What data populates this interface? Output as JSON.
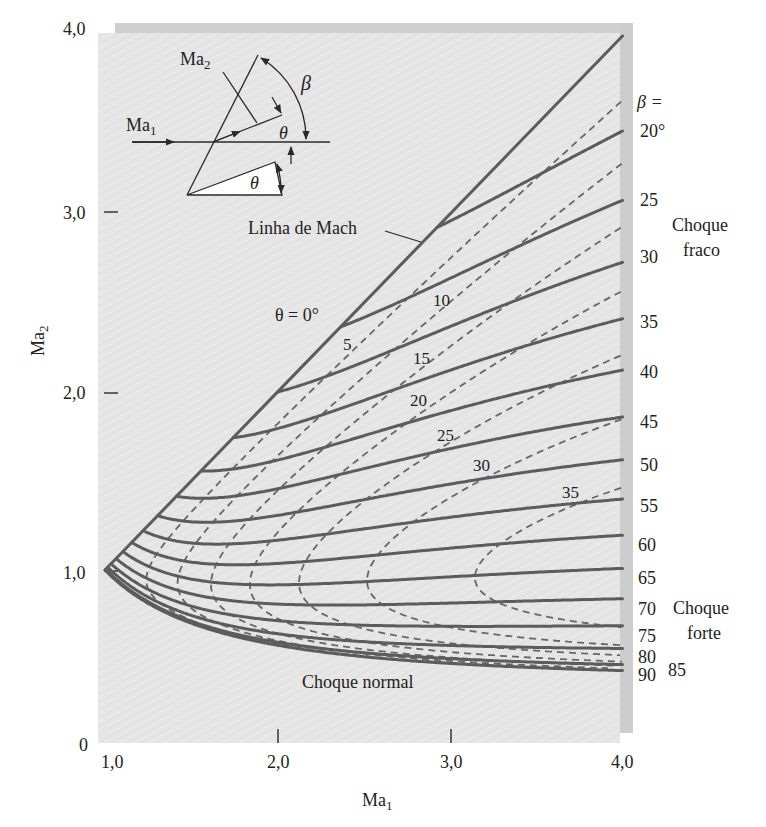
{
  "figure": {
    "y_axis": {
      "label": "Ma",
      "label_sub": "2",
      "ticks": [
        "4,0",
        "3,0",
        "2,0",
        "1,0",
        "0"
      ]
    },
    "x_axis": {
      "label": "Ma",
      "label_sub": "1",
      "ticks": [
        "1,0",
        "2,0",
        "3,0",
        "4,0"
      ]
    },
    "inset": {
      "ma1": "Ma",
      "ma1_sub": "1",
      "ma2": "Ma",
      "ma2_sub": "2",
      "beta": "β",
      "theta_flow": "θ",
      "theta_wedge": "θ"
    },
    "annotations": {
      "mach_line": "Linha de Mach",
      "theta_zero": "θ = 0°",
      "normal_shock": "Choque normal",
      "beta_header": "β =",
      "weak_shock": [
        "Choque",
        "fraco"
      ],
      "strong_shock": [
        "Choque",
        "forte"
      ]
    },
    "theta_labels": [
      "5",
      "10",
      "15",
      "20",
      "25",
      "30",
      "35"
    ],
    "beta_labels": [
      "20°",
      "25",
      "30",
      "35",
      "40",
      "45",
      "50",
      "55",
      "60",
      "65",
      "70",
      "75",
      "80",
      "85",
      "90"
    ]
  },
  "chart_data": {
    "type": "line",
    "title": "",
    "xlabel": "Ma1",
    "ylabel": "Ma2",
    "xlim": [
      1.0,
      4.0
    ],
    "ylim": [
      0,
      4.0
    ],
    "xticks": [
      "1,0",
      "2,0",
      "3,0",
      "4,0"
    ],
    "yticks": [
      "0",
      "1,0",
      "2,0",
      "3,0",
      "4,0"
    ],
    "grid": false,
    "legend": "inline labels at right edge (β) and along curves (θ)",
    "gamma": 1.4,
    "mach_line": {
      "name": "θ = 0° (Linha de Mach)",
      "style": "solid",
      "points": [
        [
          1.0,
          1.0
        ],
        [
          4.0,
          4.0
        ]
      ]
    },
    "series": [
      {
        "name": "β = 20°",
        "style": "solid",
        "beta": 20,
        "points": [
          [
            2.924,
            2.924
          ],
          [
            4.0,
            3.47
          ]
        ]
      },
      {
        "name": "β = 25°",
        "style": "solid",
        "beta": 25,
        "points": [
          [
            2.366,
            2.366
          ],
          [
            4.0,
            3.08
          ]
        ]
      },
      {
        "name": "β = 30°",
        "style": "solid",
        "beta": 30,
        "points": [
          [
            2.0,
            2.0
          ],
          [
            4.0,
            2.73
          ]
        ]
      },
      {
        "name": "β = 35°",
        "style": "solid",
        "beta": 35,
        "points": [
          [
            1.743,
            1.743
          ],
          [
            4.0,
            2.41
          ]
        ]
      },
      {
        "name": "β = 40°",
        "style": "solid",
        "beta": 40,
        "points": [
          [
            1.556,
            1.556
          ],
          [
            4.0,
            2.12
          ]
        ]
      },
      {
        "name": "β = 45°",
        "style": "solid",
        "beta": 45,
        "points": [
          [
            1.414,
            1.414
          ],
          [
            4.0,
            1.86
          ]
        ]
      },
      {
        "name": "β = 50°",
        "style": "solid",
        "beta": 50,
        "points": [
          [
            1.305,
            1.305
          ],
          [
            4.0,
            1.62
          ]
        ]
      },
      {
        "name": "β = 55°",
        "style": "solid",
        "beta": 55,
        "points": [
          [
            1.221,
            1.221
          ],
          [
            4.0,
            1.4
          ]
        ]
      },
      {
        "name": "β = 60°",
        "style": "solid",
        "beta": 60,
        "points": [
          [
            1.155,
            1.155
          ],
          [
            4.0,
            1.2
          ]
        ]
      },
      {
        "name": "β = 65°",
        "style": "solid",
        "beta": 65,
        "points": [
          [
            1.103,
            1.103
          ],
          [
            4.0,
            1.01
          ]
        ]
      },
      {
        "name": "β = 70°",
        "style": "solid",
        "beta": 70,
        "points": [
          [
            1.064,
            1.064
          ],
          [
            4.0,
            0.84
          ]
        ]
      },
      {
        "name": "β = 75°",
        "style": "solid",
        "beta": 75,
        "points": [
          [
            1.035,
            1.035
          ],
          [
            4.0,
            0.69
          ]
        ]
      },
      {
        "name": "β = 80°",
        "style": "solid",
        "beta": 80,
        "points": [
          [
            1.015,
            1.015
          ],
          [
            4.0,
            0.56
          ]
        ]
      },
      {
        "name": "β = 85°",
        "style": "solid",
        "beta": 85,
        "points": [
          [
            1.004,
            1.004
          ],
          [
            4.0,
            0.47
          ]
        ]
      },
      {
        "name": "β = 90° (Choque normal)",
        "style": "solid",
        "beta": 90,
        "points": [
          [
            1.0,
            1.0
          ],
          [
            2.0,
            0.577
          ],
          [
            3.0,
            0.475
          ],
          [
            4.0,
            0.435
          ]
        ]
      }
    ],
    "theta_series": [
      {
        "name": "θ = 5°",
        "style": "dashed",
        "theta": 5,
        "nose": [
          1.26,
          0.94
        ],
        "weak_end": [
          4.0,
          3.64
        ],
        "strong_end": [
          4.0,
          0.44
        ]
      },
      {
        "name": "θ = 10°",
        "style": "dashed",
        "theta": 10,
        "nose": [
          1.42,
          0.92
        ],
        "weak_end": [
          4.0,
          3.28
        ],
        "strong_end": [
          4.0,
          0.45
        ]
      },
      {
        "name": "θ = 15°",
        "style": "dashed",
        "theta": 15,
        "nose": [
          1.61,
          0.9
        ],
        "weak_end": [
          4.0,
          2.93
        ],
        "strong_end": [
          4.0,
          0.46
        ]
      },
      {
        "name": "θ = 20°",
        "style": "dashed",
        "theta": 20,
        "nose": [
          1.85,
          0.9
        ],
        "weak_end": [
          4.0,
          2.57
        ],
        "strong_end": [
          4.0,
          0.49
        ]
      },
      {
        "name": "θ = 25°",
        "style": "dashed",
        "theta": 25,
        "nose": [
          2.15,
          0.9
        ],
        "weak_end": [
          4.0,
          2.21
        ],
        "strong_end": [
          4.0,
          0.52
        ]
      },
      {
        "name": "θ = 30°",
        "style": "dashed",
        "theta": 30,
        "nose": [
          2.57,
          0.9
        ],
        "weak_end": [
          4.0,
          1.85
        ],
        "strong_end": [
          4.0,
          0.58
        ]
      },
      {
        "name": "θ = 35°",
        "style": "dashed",
        "theta": 35,
        "nose": [
          3.22,
          0.91
        ],
        "weak_end": [
          4.0,
          1.46
        ],
        "strong_end": [
          4.0,
          0.67
        ]
      }
    ],
    "regions": [
      "Choque fraco",
      "Choque forte",
      "Choque normal"
    ]
  }
}
